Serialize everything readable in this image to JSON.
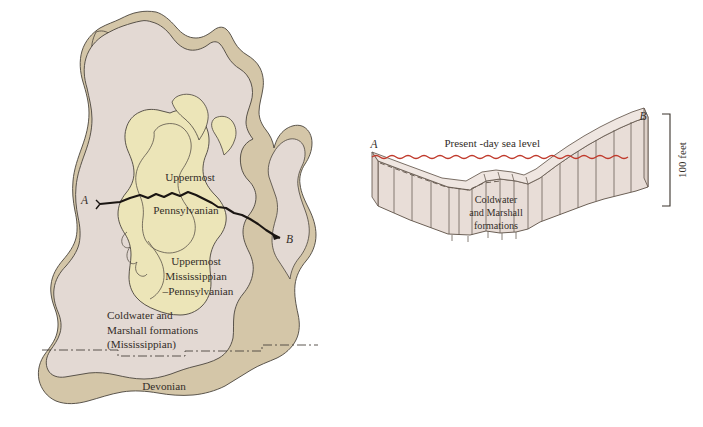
{
  "figure": {
    "title_visible": false,
    "type": "geologic-map-and-cross-section"
  },
  "map": {
    "name": "michigan-bedrock-geology-map",
    "section_line": {
      "start_label": "A",
      "end_label": "B"
    },
    "units": [
      {
        "id": "uppermost-pennsylvanian",
        "label_lines": [
          "Uppermost",
          "Pennsylvanian"
        ],
        "label_line_1": "Uppermost",
        "label_line_2": "Pennsylvanian",
        "color": "#ece5b8"
      },
      {
        "id": "uppermost-mississippian-pennsylvanian",
        "label_lines": [
          "Uppermost",
          "Mississippian",
          "–Pennsylvanian"
        ],
        "label_line_1": "Uppermost",
        "label_line_2": "Mississippian",
        "label_line_3": "–Pennsylvanian",
        "color": "#ece5b8"
      },
      {
        "id": "coldwater-marshall-mississippian",
        "label_lines": [
          "Coldwater and",
          "Marshall formations",
          "(Mississippian)"
        ],
        "label_line_1": "Coldwater and",
        "label_line_2": "Marshall formations",
        "label_line_3": "(Mississippian)",
        "color": "#e3d9d3"
      },
      {
        "id": "devonian",
        "label_lines": [
          "Devonian"
        ],
        "label_line_1": "Devonian",
        "color": "#d4c6a8"
      }
    ]
  },
  "cross_section": {
    "name": "a-b-cross-section-block-diagram",
    "start_label": "A",
    "end_label": "B",
    "sea_level_label": "Present -day sea level",
    "sea_level_color": "#c0392b",
    "formation_label_lines": [
      "Coldwater",
      "and Marshall",
      "formations"
    ],
    "formation_label_line_1": "Coldwater",
    "formation_label_line_2": "and Marshall",
    "formation_label_line_3": "formations",
    "scale_label": "100 feet",
    "block_fill": "#e8ddd7",
    "block_stroke": "#6b5f55"
  },
  "colors": {
    "unit_yellow": "#ece5b8",
    "unit_pink": "#e3d9d3",
    "unit_tan": "#d4c6a8",
    "block_face": "#e8ddd7",
    "block_top": "#efe6e1",
    "sea_level_red": "#c0392b",
    "outline_dark": "#4a443c",
    "text_dark": "#332d28"
  }
}
